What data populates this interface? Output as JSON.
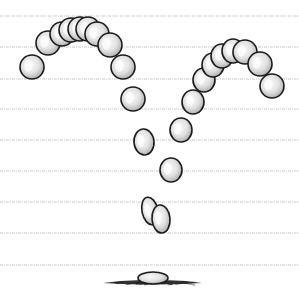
{
  "illustration": {
    "subject": "bouncing-ball-animation-arcs",
    "background": "#ffffff",
    "guide_line_color": "#c8c8c8",
    "ball_stroke": "#1a1a1a",
    "ball_fill_light": "#f4f4f4",
    "ball_fill_dark": "#b9b9b9",
    "guide_lines_y": [
      16,
      47,
      79,
      109,
      140,
      171,
      202,
      233,
      265
    ],
    "balls": [
      {
        "cx": 32,
        "cy": 67,
        "rx": 12,
        "ry": 12,
        "rot": 0
      },
      {
        "cx": 48,
        "cy": 43,
        "rx": 12,
        "ry": 12,
        "rot": 0
      },
      {
        "cx": 62,
        "cy": 34,
        "rx": 12,
        "ry": 12,
        "rot": 0
      },
      {
        "cx": 71,
        "cy": 30,
        "rx": 12,
        "ry": 12,
        "rot": 0
      },
      {
        "cx": 80,
        "cy": 29,
        "rx": 12,
        "ry": 12,
        "rot": 0
      },
      {
        "cx": 88,
        "cy": 29,
        "rx": 12,
        "ry": 12,
        "rot": 0
      },
      {
        "cx": 97,
        "cy": 34,
        "rx": 12,
        "ry": 12,
        "rot": 0
      },
      {
        "cx": 110,
        "cy": 45,
        "rx": 12,
        "ry": 12,
        "rot": 0
      },
      {
        "cx": 123,
        "cy": 67,
        "rx": 12,
        "ry": 12,
        "rot": 0
      },
      {
        "cx": 133,
        "cy": 99,
        "rx": 12,
        "ry": 12,
        "rot": 0
      },
      {
        "cx": 144,
        "cy": 142,
        "rx": 10,
        "ry": 13,
        "rot": -5
      },
      {
        "cx": 171,
        "cy": 170,
        "rx": 11,
        "ry": 12,
        "rot": 0
      },
      {
        "cx": 150,
        "cy": 211,
        "rx": 8,
        "ry": 14,
        "rot": -12
      },
      {
        "cx": 161,
        "cy": 219,
        "rx": 9,
        "ry": 14,
        "rot": -5
      },
      {
        "cx": 181,
        "cy": 130,
        "rx": 11,
        "ry": 12,
        "rot": 0
      },
      {
        "cx": 193,
        "cy": 102,
        "rx": 11,
        "ry": 12,
        "rot": 0
      },
      {
        "cx": 204,
        "cy": 80,
        "rx": 11,
        "ry": 12,
        "rot": 0
      },
      {
        "cx": 213,
        "cy": 65,
        "rx": 11,
        "ry": 12,
        "rot": 0
      },
      {
        "cx": 222,
        "cy": 56,
        "rx": 11,
        "ry": 12,
        "rot": 0
      },
      {
        "cx": 233,
        "cy": 51,
        "rx": 11,
        "ry": 12,
        "rot": 0
      },
      {
        "cx": 245,
        "cy": 52,
        "rx": 12,
        "ry": 12,
        "rot": 0
      },
      {
        "cx": 260,
        "cy": 64,
        "rx": 12,
        "ry": 12,
        "rot": 0
      },
      {
        "cx": 272,
        "cy": 86,
        "rx": 12,
        "ry": 12,
        "rot": 0
      }
    ],
    "squashed_ball": {
      "cx": 153,
      "cy": 278,
      "rx": 15,
      "ry": 6
    },
    "ground_shadow": {
      "x1": 103,
      "x2": 202,
      "y": 283
    }
  }
}
